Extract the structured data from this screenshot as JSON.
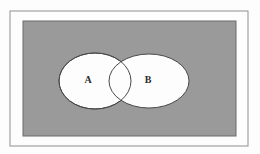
{
  "figure": {
    "kind": "venn-diagram",
    "title": "",
    "canvas": {
      "width": 260,
      "height": 154,
      "background": "#fdfdfd"
    },
    "outer_frame": {
      "name": "outer-frame",
      "x": 10,
      "y": 11,
      "width": 238,
      "height": 135,
      "stroke": "#8f8f8f",
      "stroke_width": 1,
      "fill": "none"
    },
    "universal_set": {
      "name": "universal-set-rectangle",
      "label": "",
      "x": 23,
      "y": 21,
      "width": 213,
      "height": 115,
      "fill": "#9a9a9a",
      "stroke": "#6b6b6b",
      "stroke_width": 1
    },
    "sets": [
      {
        "id": "A",
        "label": "A",
        "shape": "ellipse",
        "cx": 95,
        "cy": 81,
        "rx": 36,
        "ry": 28,
        "fill": "#fdfdfd",
        "stroke": "#4a4a4a",
        "stroke_width": 1,
        "label_x": 88,
        "label_y": 81
      },
      {
        "id": "B",
        "label": "B",
        "shape": "ellipse",
        "cx": 149,
        "cy": 81,
        "rx": 40,
        "ry": 27,
        "fill": "#fdfdfd",
        "stroke": "#4a4a4a",
        "stroke_width": 1,
        "label_x": 148,
        "label_y": 81
      }
    ],
    "intersection": {
      "name": "intersection-region",
      "label": "",
      "fill": "#fdfdfd"
    },
    "colors": {
      "universe_gray": "#9a9a9a",
      "set_fill": "#fdfdfd",
      "outline": "#4a4a4a",
      "frame": "#8f8f8f",
      "label_text": "#2b2b2b"
    }
  }
}
